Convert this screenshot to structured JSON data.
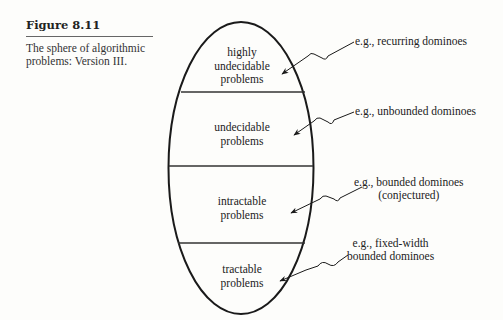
{
  "caption": {
    "figure_number": "Figure 8.11",
    "text": "The sphere of algorithmic problems: Version III."
  },
  "regions": [
    {
      "label": "highly undecidable problems",
      "lines": [
        "highly",
        "undecidable",
        "problems"
      ]
    },
    {
      "label": "undecidable problems",
      "lines": [
        "undecidable",
        "problems"
      ]
    },
    {
      "label": "intractable problems",
      "lines": [
        "intractable",
        "problems"
      ]
    },
    {
      "label": "tractable problems",
      "lines": [
        "tractable",
        "problems"
      ]
    }
  ],
  "examples": [
    {
      "lines": [
        "e.g., recurring dominoes"
      ]
    },
    {
      "lines": [
        "e.g., unbounded dominoes"
      ]
    },
    {
      "lines": [
        "e.g., bounded dominoes",
        "(conjectured)"
      ]
    },
    {
      "lines": [
        "e.g., fixed-width",
        "bounded dominoes"
      ]
    }
  ]
}
